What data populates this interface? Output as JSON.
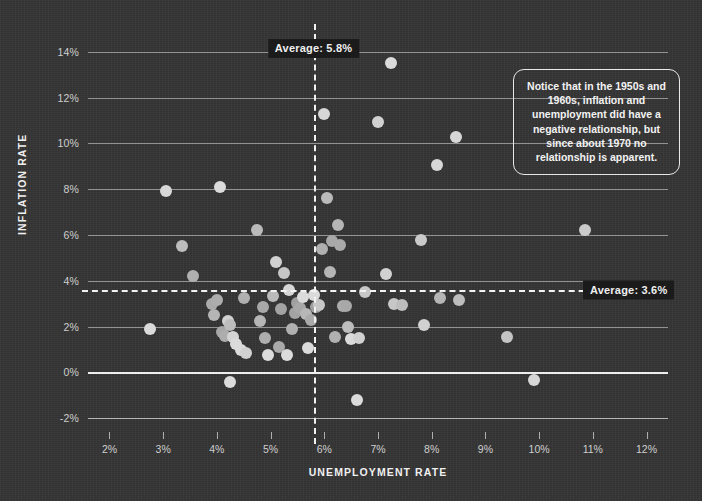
{
  "chart_data": {
    "type": "scatter",
    "title": "",
    "xlabel": "UNEMPLOYMENT RATE",
    "ylabel": "INFLATION RATE",
    "xlim": [
      1.6,
      12.4
    ],
    "ylim": [
      -2.6,
      14.6
    ],
    "xticks": [
      "2%",
      "3%",
      "4%",
      "5%",
      "6%",
      "7%",
      "8%",
      "9%",
      "10%",
      "11%",
      "12%"
    ],
    "xtick_values": [
      2,
      3,
      4,
      5,
      6,
      7,
      8,
      9,
      10,
      11,
      12
    ],
    "yticks": [
      "-2%",
      "0%",
      "2%",
      "4%",
      "6%",
      "8%",
      "10%",
      "12%",
      "14%"
    ],
    "ytick_values": [
      -2,
      0,
      2,
      4,
      6,
      8,
      10,
      12,
      14
    ],
    "grid": "horizontal",
    "legend": "none",
    "point_color": "#b9b9b9",
    "point_radius_px": 6,
    "reference_lines": [
      {
        "name": "average-unemployment",
        "orientation": "vertical",
        "value": 5.8,
        "label": "Average: 5.8%",
        "style": "dashed"
      },
      {
        "name": "average-inflation",
        "orientation": "horizontal",
        "value": 3.6,
        "label": "Average: 3.6%",
        "style": "dashed"
      }
    ],
    "points": [
      {
        "x": 2.75,
        "y": 1.9,
        "s": 0.95
      },
      {
        "x": 3.05,
        "y": 7.9,
        "s": 0.92
      },
      {
        "x": 3.35,
        "y": 5.5,
        "s": 0.72
      },
      {
        "x": 3.55,
        "y": 4.2,
        "s": 0.62
      },
      {
        "x": 3.9,
        "y": 3.0,
        "s": 0.58
      },
      {
        "x": 3.95,
        "y": 2.5,
        "s": 0.66
      },
      {
        "x": 4.0,
        "y": 3.15,
        "s": 0.6
      },
      {
        "x": 4.05,
        "y": 8.1,
        "s": 0.95
      },
      {
        "x": 4.1,
        "y": 1.75,
        "s": 0.55
      },
      {
        "x": 4.15,
        "y": 1.6,
        "s": 0.6
      },
      {
        "x": 4.2,
        "y": 2.25,
        "s": 0.88
      },
      {
        "x": 4.25,
        "y": 2.05,
        "s": 0.72
      },
      {
        "x": 4.3,
        "y": 1.55,
        "s": 0.9
      },
      {
        "x": 4.35,
        "y": 1.25,
        "s": 0.95
      },
      {
        "x": 4.45,
        "y": 1.0,
        "s": 0.95
      },
      {
        "x": 4.5,
        "y": 3.25,
        "s": 0.62
      },
      {
        "x": 4.25,
        "y": -0.4,
        "s": 0.95
      },
      {
        "x": 4.55,
        "y": 0.85,
        "s": 0.88
      },
      {
        "x": 4.75,
        "y": 6.2,
        "s": 0.7
      },
      {
        "x": 4.8,
        "y": 2.25,
        "s": 0.66
      },
      {
        "x": 4.85,
        "y": 2.85,
        "s": 0.56
      },
      {
        "x": 4.9,
        "y": 1.5,
        "s": 0.6
      },
      {
        "x": 4.95,
        "y": 0.75,
        "s": 0.95
      },
      {
        "x": 5.05,
        "y": 3.35,
        "s": 0.7
      },
      {
        "x": 5.1,
        "y": 4.8,
        "s": 0.88
      },
      {
        "x": 5.15,
        "y": 1.1,
        "s": 0.58
      },
      {
        "x": 5.2,
        "y": 2.75,
        "s": 0.52
      },
      {
        "x": 5.25,
        "y": 4.35,
        "s": 0.8
      },
      {
        "x": 5.3,
        "y": 0.75,
        "s": 0.95
      },
      {
        "x": 5.35,
        "y": 3.6,
        "s": 0.92
      },
      {
        "x": 5.4,
        "y": 1.9,
        "s": 0.62
      },
      {
        "x": 5.45,
        "y": 2.6,
        "s": 0.52
      },
      {
        "x": 5.5,
        "y": 3.05,
        "s": 0.5
      },
      {
        "x": 5.55,
        "y": 2.8,
        "s": 0.56
      },
      {
        "x": 5.6,
        "y": 3.3,
        "s": 0.95
      },
      {
        "x": 5.65,
        "y": 2.55,
        "s": 0.68
      },
      {
        "x": 5.7,
        "y": 1.05,
        "s": 0.95
      },
      {
        "x": 5.75,
        "y": 2.3,
        "s": 0.58
      },
      {
        "x": 5.8,
        "y": 3.4,
        "s": 0.95
      },
      {
        "x": 5.85,
        "y": 2.85,
        "s": 0.5
      },
      {
        "x": 5.9,
        "y": 2.95,
        "s": 0.8
      },
      {
        "x": 5.95,
        "y": 5.4,
        "s": 0.62
      },
      {
        "x": 6.0,
        "y": 11.3,
        "s": 0.92
      },
      {
        "x": 6.05,
        "y": 7.6,
        "s": 0.7
      },
      {
        "x": 6.1,
        "y": 4.4,
        "s": 0.66
      },
      {
        "x": 6.15,
        "y": 5.75,
        "s": 0.56
      },
      {
        "x": 6.2,
        "y": 1.55,
        "s": 0.62
      },
      {
        "x": 6.25,
        "y": 6.45,
        "s": 0.66
      },
      {
        "x": 6.3,
        "y": 5.55,
        "s": 0.58
      },
      {
        "x": 6.35,
        "y": 2.9,
        "s": 0.6
      },
      {
        "x": 6.4,
        "y": 2.9,
        "s": 0.56
      },
      {
        "x": 6.45,
        "y": 2.0,
        "s": 0.72
      },
      {
        "x": 6.5,
        "y": 1.45,
        "s": 0.95
      },
      {
        "x": 6.6,
        "y": -1.2,
        "s": 0.95
      },
      {
        "x": 6.65,
        "y": 1.5,
        "s": 0.88
      },
      {
        "x": 6.75,
        "y": 3.5,
        "s": 0.8
      },
      {
        "x": 7.0,
        "y": 10.95,
        "s": 0.88
      },
      {
        "x": 7.15,
        "y": 4.3,
        "s": 0.88
      },
      {
        "x": 7.25,
        "y": 13.5,
        "s": 0.95
      },
      {
        "x": 7.3,
        "y": 3.0,
        "s": 0.8
      },
      {
        "x": 7.45,
        "y": 2.95,
        "s": 0.72
      },
      {
        "x": 7.8,
        "y": 5.8,
        "s": 0.82
      },
      {
        "x": 7.85,
        "y": 2.05,
        "s": 0.88
      },
      {
        "x": 8.1,
        "y": 9.05,
        "s": 0.92
      },
      {
        "x": 8.15,
        "y": 3.25,
        "s": 0.66
      },
      {
        "x": 8.45,
        "y": 10.3,
        "s": 0.92
      },
      {
        "x": 8.5,
        "y": 3.15,
        "s": 0.72
      },
      {
        "x": 9.4,
        "y": 1.55,
        "s": 0.78
      },
      {
        "x": 9.9,
        "y": -0.35,
        "s": 0.92
      },
      {
        "x": 10.85,
        "y": 6.2,
        "s": 0.82
      }
    ],
    "annotation": {
      "name": "insight-callout",
      "text": "Notice that in the 1950s and 1960s, inflation and unemployment did have a negative relationship, but since about 1970 no relationship is apparent."
    }
  },
  "colors": {
    "background": "#343434",
    "gridline": "#e8e8e8",
    "axis": "#f8f8f8",
    "text": "#f0f0f0",
    "badge_background": "#1b1b1b",
    "point": "#b9b9b9"
  }
}
